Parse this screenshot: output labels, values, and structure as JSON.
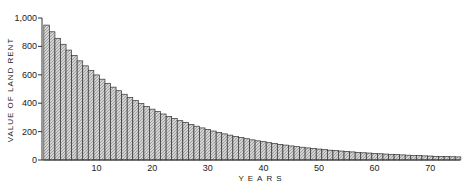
{
  "chart_data": {
    "type": "bar",
    "title": "",
    "xlabel": "YEARS",
    "ylabel": "VALUE OF LAND RENT",
    "ylim": [
      0,
      1000
    ],
    "xlim": [
      0,
      75
    ],
    "grid": false,
    "legend": null,
    "y_ticks": [
      0,
      200,
      400,
      600,
      800,
      1000
    ],
    "y_tick_labels": [
      "0",
      "200",
      "400",
      "600",
      "800",
      "1,000"
    ],
    "x_ticks": [
      10,
      20,
      30,
      40,
      50,
      60,
      70
    ],
    "x_tick_labels": [
      "10",
      "20",
      "30",
      "40",
      "50",
      "60",
      "70"
    ],
    "categories": [
      1,
      2,
      3,
      4,
      5,
      6,
      7,
      8,
      9,
      10,
      11,
      12,
      13,
      14,
      15,
      16,
      17,
      18,
      19,
      20,
      21,
      22,
      23,
      24,
      25,
      26,
      27,
      28,
      29,
      30,
      31,
      32,
      33,
      34,
      35,
      36,
      37,
      38,
      39,
      40,
      41,
      42,
      43,
      44,
      45,
      46,
      47,
      48,
      49,
      50,
      51,
      52,
      53,
      54,
      55,
      56,
      57,
      58,
      59,
      60,
      61,
      62,
      63,
      64,
      65,
      66,
      67,
      68,
      69,
      70,
      71,
      72,
      73,
      74,
      75
    ],
    "values": [
      950,
      903,
      857,
      815,
      774,
      735,
      698,
      663,
      630,
      599,
      569,
      540,
      513,
      488,
      463,
      440,
      418,
      397,
      377,
      358,
      341,
      324,
      307,
      292,
      277,
      264,
      250,
      238,
      226,
      215,
      204,
      194,
      184,
      175,
      166,
      158,
      150,
      142,
      135,
      129,
      122,
      116,
      110,
      105,
      99,
      94,
      90,
      85,
      81,
      77,
      73,
      69,
      66,
      63,
      60,
      57,
      54,
      51,
      49,
      46,
      44,
      42,
      40,
      38,
      36,
      34,
      32,
      31,
      29,
      28,
      26,
      25,
      24,
      23,
      22
    ],
    "series": [
      {
        "name": "Value of land rent",
        "values": [
          950,
          903,
          857,
          815,
          774,
          735,
          698,
          663,
          630,
          599,
          569,
          540,
          513,
          488,
          463,
          440,
          418,
          397,
          377,
          358,
          341,
          324,
          307,
          292,
          277,
          264,
          250,
          238,
          226,
          215,
          204,
          194,
          184,
          175,
          166,
          158,
          150,
          142,
          135,
          129,
          122,
          116,
          110,
          105,
          99,
          94,
          90,
          85,
          81,
          77,
          73,
          69,
          66,
          63,
          60,
          57,
          54,
          51,
          49,
          46,
          44,
          42,
          40,
          38,
          36,
          34,
          32,
          31,
          29,
          28,
          26,
          25,
          24,
          23,
          22
        ]
      }
    ],
    "colors": {
      "bar_fill": "#bdbdbd",
      "bar_stroke": "#333333",
      "axis": "#333333"
    }
  }
}
